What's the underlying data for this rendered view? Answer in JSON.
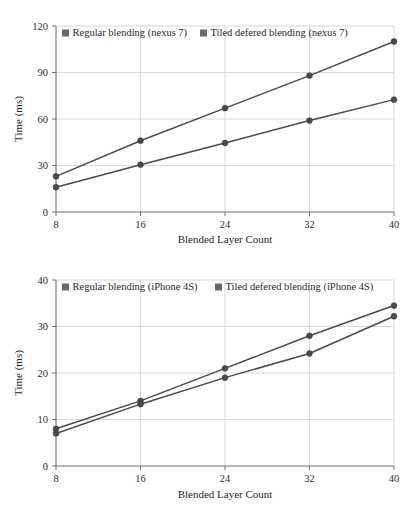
{
  "chart_data": [
    {
      "id": "nexus7",
      "type": "line",
      "title": "",
      "xlabel": "Blended Layer Count",
      "ylabel": "Time (ms)",
      "x": [
        8,
        16,
        24,
        32,
        40
      ],
      "xticklabels": [
        "8",
        "16",
        "24",
        "32",
        "40"
      ],
      "yticks": [
        0,
        30,
        60,
        90,
        120
      ],
      "yticklabels": [
        "0",
        "30",
        "60",
        "90",
        "120"
      ],
      "xlim": [
        8,
        40
      ],
      "ylim": [
        0,
        120
      ],
      "grid": true,
      "legend_position": "top-left-inside",
      "series": [
        {
          "name": "Regular blending (nexus 7)",
          "color": "#4a4a4a",
          "marker": "circle",
          "values": [
            23,
            46,
            67,
            88,
            110
          ]
        },
        {
          "name": "Tiled defered blending (nexus 7)",
          "color": "#4a4a4a",
          "marker": "circle",
          "values": [
            16,
            30.5,
            44.5,
            59,
            72.5
          ]
        }
      ]
    },
    {
      "id": "iphone4s",
      "type": "line",
      "title": "",
      "xlabel": "Blended Layer Count",
      "ylabel": "Time (ms)",
      "x": [
        8,
        16,
        24,
        32,
        40
      ],
      "xticklabels": [
        "8",
        "16",
        "24",
        "32",
        "40"
      ],
      "yticks": [
        0,
        10,
        20,
        30,
        40
      ],
      "yticklabels": [
        "0",
        "10",
        "20",
        "30",
        "40"
      ],
      "xlim": [
        8,
        40
      ],
      "ylim": [
        0,
        40
      ],
      "grid": true,
      "legend_position": "top-left-inside",
      "series": [
        {
          "name": "Regular blending (iPhone 4S)",
          "color": "#4a4a4a",
          "marker": "circle",
          "values": [
            8,
            14,
            21,
            28,
            34.5
          ]
        },
        {
          "name": "Tiled defered blending (iPhone 4S)",
          "color": "#4a4a4a",
          "marker": "circle",
          "values": [
            7,
            13.3,
            19,
            24.2,
            32.2
          ]
        }
      ]
    }
  ],
  "colors": {
    "series": "#4a4a4a",
    "grid": "#d2d2d2",
    "axis": "#6f6f6f",
    "text": "#1f1f1f",
    "background": "#ffffff"
  }
}
